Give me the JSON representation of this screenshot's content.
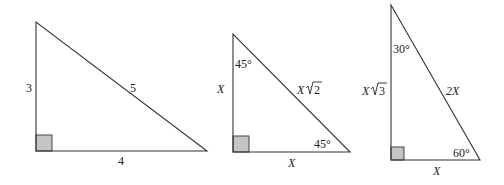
{
  "diagram": {
    "triangles": [
      {
        "id": "t345",
        "type": "3-4-5 right triangle",
        "labels": {
          "vertical_side": "3",
          "hypotenuse": "5",
          "base": "4"
        }
      },
      {
        "id": "t454590",
        "type": "45-45-90 right triangle",
        "labels": {
          "top_angle": "45°",
          "vertical_side": "X",
          "hypotenuse_var": "X",
          "hypotenuse_root": "2",
          "bottom_angle": "45°",
          "base": "X"
        }
      },
      {
        "id": "t306090",
        "type": "30-60-90 right triangle",
        "labels": {
          "top_angle": "30°",
          "vertical_side_var": "X",
          "vertical_side_root": "3",
          "hypotenuse": "2X",
          "bottom_angle": "60°",
          "base": "X"
        }
      }
    ],
    "colors": {
      "line": "#333333",
      "right_angle_fill": "#c4c4c4",
      "background": "#ffffff"
    }
  }
}
